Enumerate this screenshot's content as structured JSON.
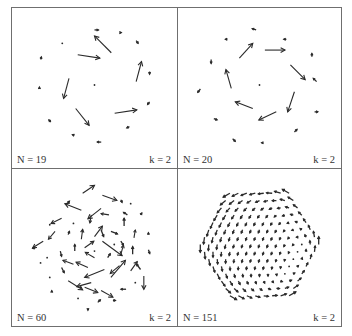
{
  "figure": {
    "stroke_color": "#2a2a2a",
    "frame_color": "#6f6f6f"
  },
  "chart_data": [
    {
      "type": "vector-field",
      "title": "",
      "n_label": "N = 19",
      "k_label": "k = 2",
      "N": 19,
      "k": 2,
      "xlim": [
        -1,
        1
      ],
      "ylim": [
        -1,
        1
      ],
      "arrows": [
        {
          "x": -0.25,
          "y": 0.45,
          "dx": 0.33,
          "dy": -0.05
        },
        {
          "x": 0.25,
          "y": 0.48,
          "dx": -0.25,
          "dy": 0.25
        },
        {
          "x": 0.62,
          "y": 0.05,
          "dx": 0.08,
          "dy": 0.3
        },
        {
          "x": 0.3,
          "y": -0.42,
          "dx": 0.33,
          "dy": 0.05
        },
        {
          "x": -0.28,
          "y": -0.35,
          "dx": 0.2,
          "dy": -0.25
        },
        {
          "x": -0.38,
          "y": 0.1,
          "dx": -0.08,
          "dy": -0.3
        },
        {
          "x": 0.0,
          "y": 0.82,
          "dx": 0.06,
          "dy": 0.0
        },
        {
          "x": 0.62,
          "y": 0.66,
          "dx": 0.03,
          "dy": -0.04
        },
        {
          "x": 0.82,
          "y": 0.2,
          "dx": 0.0,
          "dy": -0.04
        },
        {
          "x": 0.82,
          "y": -0.25,
          "dx": -0.03,
          "dy": -0.04
        },
        {
          "x": 0.52,
          "y": -0.62,
          "dx": -0.04,
          "dy": -0.02
        },
        {
          "x": 0.1,
          "y": -0.85,
          "dx": -0.06,
          "dy": 0.0
        },
        {
          "x": -0.3,
          "y": -0.75,
          "dx": -0.03,
          "dy": 0.01
        },
        {
          "x": -0.65,
          "y": -0.55,
          "dx": -0.03,
          "dy": 0.03
        },
        {
          "x": -0.82,
          "y": -0.05,
          "dx": 0.0,
          "dy": 0.02
        },
        {
          "x": -0.8,
          "y": 0.38,
          "dx": 0.01,
          "dy": 0.04
        },
        {
          "x": -0.48,
          "y": 0.62,
          "dx": -0.01,
          "dy": 0.0
        },
        {
          "x": 0.38,
          "y": 0.78,
          "dx": 0.02,
          "dy": 0.0
        },
        {
          "x": 0.0,
          "y": 0.0,
          "dx": 0.0,
          "dy": 0.0
        }
      ]
    },
    {
      "type": "vector-field",
      "title": "",
      "n_label": "N = 20",
      "k_label": "k = 2",
      "N": 20,
      "k": 2,
      "xlim": [
        -1,
        1
      ],
      "ylim": [
        -1,
        1
      ],
      "arrows": [
        {
          "x": -0.3,
          "y": 0.4,
          "dx": 0.2,
          "dy": 0.22
        },
        {
          "x": 0.08,
          "y": 0.52,
          "dx": 0.3,
          "dy": 0.0
        },
        {
          "x": 0.46,
          "y": 0.3,
          "dx": 0.22,
          "dy": -0.22
        },
        {
          "x": 0.52,
          "y": -0.1,
          "dx": -0.1,
          "dy": -0.3
        },
        {
          "x": 0.25,
          "y": -0.4,
          "dx": -0.26,
          "dy": -0.12
        },
        {
          "x": -0.1,
          "y": -0.35,
          "dx": -0.26,
          "dy": 0.1
        },
        {
          "x": -0.42,
          "y": -0.05,
          "dx": -0.08,
          "dy": 0.28
        },
        {
          "x": -0.05,
          "y": 0.82,
          "dx": -0.06,
          "dy": 0.02
        },
        {
          "x": 0.4,
          "y": 0.68,
          "dx": -0.04,
          "dy": 0.0
        },
        {
          "x": 0.78,
          "y": 0.42,
          "dx": 0.0,
          "dy": 0.05
        },
        {
          "x": 0.85,
          "y": 0.05,
          "dx": -0.05,
          "dy": 0.05
        },
        {
          "x": 0.82,
          "y": -0.4,
          "dx": 0.05,
          "dy": 0.0
        },
        {
          "x": 0.52,
          "y": -0.7,
          "dx": 0.04,
          "dy": 0.04
        },
        {
          "x": 0.05,
          "y": -0.86,
          "dx": -0.02,
          "dy": 0.0
        },
        {
          "x": -0.4,
          "y": -0.8,
          "dx": 0.04,
          "dy": -0.04
        },
        {
          "x": -0.68,
          "y": -0.5,
          "dx": 0.05,
          "dy": -0.02
        },
        {
          "x": -0.88,
          "y": -0.06,
          "dx": -0.04,
          "dy": -0.05
        },
        {
          "x": -0.72,
          "y": 0.38,
          "dx": 0.0,
          "dy": -0.06
        },
        {
          "x": -0.48,
          "y": 0.68,
          "dx": -0.03,
          "dy": 0.0
        },
        {
          "x": 0.0,
          "y": 0.0,
          "dx": 0.0,
          "dy": 0.0
        }
      ]
    },
    {
      "type": "vector-field",
      "title": "",
      "n_label": "N = 60",
      "k_label": "k = 2",
      "N": 60,
      "k": 2,
      "xlim": [
        -1,
        1
      ],
      "ylim": [
        -1,
        1
      ],
      "arrows": [
        {
          "x": -0.18,
          "y": 0.78,
          "dx": 0.18,
          "dy": 0.12
        },
        {
          "x": 0.12,
          "y": 0.75,
          "dx": 0.22,
          "dy": -0.08
        },
        {
          "x": 0.4,
          "y": 0.68,
          "dx": 0.02,
          "dy": -0.04
        },
        {
          "x": -0.42,
          "y": 0.62,
          "dx": 0.04,
          "dy": 0.04
        },
        {
          "x": -0.2,
          "y": 0.52,
          "dx": -0.25,
          "dy": 0.1
        },
        {
          "x": 0.1,
          "y": 0.55,
          "dx": -0.2,
          "dy": -0.16
        },
        {
          "x": -0.05,
          "y": 0.45,
          "dx": -0.02,
          "dy": -0.12
        },
        {
          "x": 0.22,
          "y": 0.45,
          "dx": -0.12,
          "dy": 0.02
        },
        {
          "x": -0.5,
          "y": 0.4,
          "dx": -0.16,
          "dy": -0.08
        },
        {
          "x": 0.5,
          "y": 0.45,
          "dx": -0.06,
          "dy": 0.04
        },
        {
          "x": 0.7,
          "y": 0.45,
          "dx": 0.02,
          "dy": 0.03
        },
        {
          "x": 0.45,
          "y": 0.28,
          "dx": 0.0,
          "dy": 0.12
        },
        {
          "x": -0.6,
          "y": 0.2,
          "dx": -0.1,
          "dy": -0.12
        },
        {
          "x": -0.4,
          "y": 0.15,
          "dx": 0.02,
          "dy": 0.05
        },
        {
          "x": -0.2,
          "y": 0.08,
          "dx": 0.02,
          "dy": 0.15
        },
        {
          "x": 0.0,
          "y": 0.12,
          "dx": 0.12,
          "dy": 0.16
        },
        {
          "x": 0.1,
          "y": 0.22,
          "dx": 0.04,
          "dy": -0.1
        },
        {
          "x": 0.25,
          "y": 0.2,
          "dx": 0.1,
          "dy": -0.04
        },
        {
          "x": 0.12,
          "y": 0.05,
          "dx": 0.3,
          "dy": -0.22
        },
        {
          "x": 0.4,
          "y": 0.05,
          "dx": 0.04,
          "dy": -0.06
        },
        {
          "x": 0.6,
          "y": 0.1,
          "dx": 0.02,
          "dy": 0.12
        },
        {
          "x": -0.78,
          "y": 0.05,
          "dx": -0.16,
          "dy": -0.1
        },
        {
          "x": -0.9,
          "y": -0.05,
          "dx": -0.04,
          "dy": -0.01
        },
        {
          "x": 0.82,
          "y": 0.15,
          "dx": 0.0,
          "dy": 0.03
        },
        {
          "x": -0.52,
          "y": -0.1,
          "dx": 0.02,
          "dy": -0.08
        },
        {
          "x": -0.3,
          "y": -0.1,
          "dx": 0.0,
          "dy": 0.1
        },
        {
          "x": -0.15,
          "y": -0.05,
          "dx": 0.14,
          "dy": 0.1
        },
        {
          "x": 0.0,
          "y": -0.2,
          "dx": -0.14,
          "dy": 0.08
        },
        {
          "x": 0.2,
          "y": -0.2,
          "dx": 0.04,
          "dy": 0.06
        },
        {
          "x": 0.4,
          "y": -0.15,
          "dx": 0.04,
          "dy": 0.14
        },
        {
          "x": 0.58,
          "y": -0.15,
          "dx": 0.0,
          "dy": 0.12
        },
        {
          "x": 0.82,
          "y": -0.08,
          "dx": 0.02,
          "dy": -0.06
        },
        {
          "x": -0.82,
          "y": -0.28,
          "dx": 0.0,
          "dy": 0.01
        },
        {
          "x": -0.5,
          "y": -0.35,
          "dx": 0.04,
          "dy": -0.08
        },
        {
          "x": -0.32,
          "y": -0.3,
          "dx": -0.16,
          "dy": 0.06
        },
        {
          "x": -0.1,
          "y": -0.35,
          "dx": -0.18,
          "dy": 0.08
        },
        {
          "x": 0.15,
          "y": -0.38,
          "dx": -0.3,
          "dy": -0.12
        },
        {
          "x": 0.38,
          "y": -0.32,
          "dx": -0.14,
          "dy": -0.12
        },
        {
          "x": 0.25,
          "y": -0.5,
          "dx": 0.22,
          "dy": 0.26
        },
        {
          "x": 0.55,
          "y": -0.4,
          "dx": 0.1,
          "dy": 0.14
        },
        {
          "x": 0.7,
          "y": -0.38,
          "dx": -0.06,
          "dy": 0.08
        },
        {
          "x": 0.75,
          "y": -0.48,
          "dx": 0.0,
          "dy": -0.2
        },
        {
          "x": -0.68,
          "y": -0.5,
          "dx": 0.0,
          "dy": 0.01
        },
        {
          "x": -0.4,
          "y": -0.55,
          "dx": 0.22,
          "dy": -0.14
        },
        {
          "x": -0.15,
          "y": -0.65,
          "dx": 0.2,
          "dy": -0.08
        },
        {
          "x": -0.05,
          "y": -0.58,
          "dx": -0.22,
          "dy": -0.06
        },
        {
          "x": 0.1,
          "y": -0.7,
          "dx": 0.18,
          "dy": -0.1
        },
        {
          "x": 0.48,
          "y": -0.68,
          "dx": -0.08,
          "dy": 0.0
        },
        {
          "x": -0.65,
          "y": -0.72,
          "dx": 0.0,
          "dy": 0.02
        },
        {
          "x": -0.25,
          "y": -0.82,
          "dx": 0.01,
          "dy": 0.0
        },
        {
          "x": 0.05,
          "y": -0.88,
          "dx": 0.04,
          "dy": 0.04
        },
        {
          "x": 0.28,
          "y": -0.85,
          "dx": 0.04,
          "dy": 0.0
        },
        {
          "x": -0.1,
          "y": -0.98,
          "dx": 0.0,
          "dy": -0.02
        },
        {
          "x": 0.3,
          "y": 0.0,
          "dx": 0.0,
          "dy": 0.0
        },
        {
          "x": -0.68,
          "y": 0.3,
          "dx": 0.0,
          "dy": 0.0
        },
        {
          "x": -0.72,
          "y": -0.2,
          "dx": 0.0,
          "dy": 0.0
        },
        {
          "x": 0.0,
          "y": -0.1,
          "dx": 0.0,
          "dy": 0.0
        },
        {
          "x": 0.55,
          "y": 0.62,
          "dx": 0.0,
          "dy": 0.0
        },
        {
          "x": -0.32,
          "y": 0.32,
          "dx": 0.0,
          "dy": 0.0
        },
        {
          "x": 0.62,
          "y": -0.58,
          "dx": 0.0,
          "dy": 0.0
        }
      ]
    },
    {
      "type": "vector-field",
      "title": "",
      "n_label": "N = 151",
      "k_label": "k = 2",
      "N": 151,
      "k": 2,
      "xlim": [
        -1,
        1
      ],
      "ylim": [
        -1,
        1
      ],
      "field": {
        "kind": "hex-lattice-disk",
        "rings": 7,
        "radius": 0.9,
        "rotation": "counterclockwise",
        "edge_magnitude": 0.12,
        "core_direction_deg": 250,
        "core_magnitude": 0.05
      }
    }
  ]
}
